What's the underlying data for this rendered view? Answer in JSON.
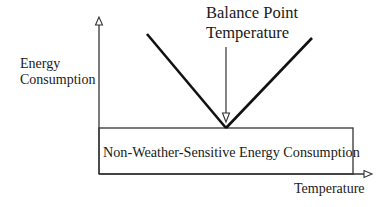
{
  "diagram": {
    "type": "balance-point-energy-model",
    "y_axis_label_line1": "Energy",
    "y_axis_label_line2": "Consumption",
    "x_axis_label": "Temperature",
    "balance_point_line1": "Balance Point",
    "balance_point_line2": "Temperature",
    "baseload_label": "Non-Weather-Sensitive Energy Consumption",
    "colors": {
      "line": "#111111",
      "axis": "#333333",
      "text": "#1a1a1a",
      "background": "#ffffff"
    }
  }
}
